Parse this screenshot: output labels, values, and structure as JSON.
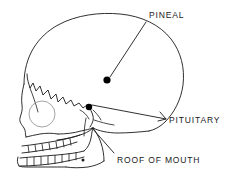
{
  "diagram": {
    "view": "lateral",
    "style": "line-drawing",
    "background_color": "#ffffff",
    "line_color": "#1a1a1a",
    "orbit_color": "#9a9a9a",
    "marker_color": "#000000",
    "labels": [
      {
        "id": "pineal",
        "text": "PINEAL",
        "text_x": 149,
        "text_y": 11,
        "marker_x": 107,
        "marker_y": 80,
        "marker_shape": "filled-circle",
        "marker_radius": 3.6,
        "leader_from_x": 146,
        "leader_from_y": 22,
        "leader_to_x": 110,
        "leader_to_y": 77
      },
      {
        "id": "pituitary",
        "text": "PITUITARY",
        "text_x": 169,
        "text_y": 116,
        "marker_x": 89,
        "marker_y": 107,
        "marker_shape": "filled-circle",
        "marker_radius": 3.2,
        "leader_from_x": 166,
        "leader_from_y": 119,
        "leader_to_x": 92,
        "leader_to_y": 105
      },
      {
        "id": "roof-of-mouth",
        "text": "ROOF OF MOUTH",
        "text_x": 117,
        "text_y": 156,
        "marker_shape": "none",
        "leader_from_x": 114,
        "leader_from_y": 153,
        "leader_to_x": 92,
        "leader_to_y": 128
      }
    ],
    "features": [
      {
        "id": "cranium",
        "name": "cranial vault"
      },
      {
        "id": "coronal-suture",
        "name": "jagged suture line"
      },
      {
        "id": "orbit",
        "name": "eye socket",
        "cx": 42,
        "cy": 114,
        "r": 13
      },
      {
        "id": "upper-teeth",
        "name": "upper tooth row",
        "count": 8
      },
      {
        "id": "lower-teeth",
        "name": "lower tooth row",
        "count": 8
      },
      {
        "id": "mandible",
        "name": "lower jaw"
      },
      {
        "id": "mental-foramen",
        "name": "small dot on jaw",
        "cx": 83,
        "cy": 160,
        "r": 1.5
      }
    ]
  }
}
